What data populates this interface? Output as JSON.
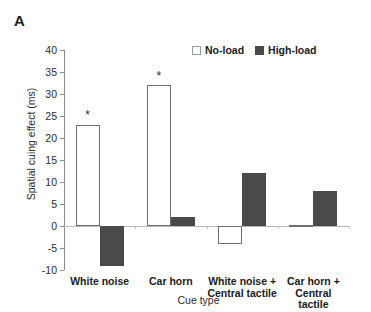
{
  "panel": {
    "letter": "A"
  },
  "chart_data": {
    "type": "bar",
    "title": "",
    "xlabel": "Cue type",
    "ylabel": "Spatial cuing effect (ms)",
    "categories": [
      "White noise",
      "Car horn",
      "White noise +\nCentral tactile",
      "Car horn +\nCentral tactile"
    ],
    "series": [
      {
        "name": "No-load",
        "values": [
          23,
          32,
          -4,
          0.3
        ],
        "color": "#ffffff",
        "edge": "#6e6e6e"
      },
      {
        "name": "High-load",
        "values": [
          -9,
          2,
          12,
          8
        ],
        "color": "#4a4a4a",
        "edge": "#4a4a4a"
      }
    ],
    "ylim": [
      -10,
      40
    ],
    "yticks": [
      40,
      35,
      30,
      25,
      20,
      15,
      10,
      5,
      0,
      -5,
      -10
    ],
    "ytick_labels": [
      "40",
      "35",
      "30",
      "25",
      "20",
      "15",
      "10",
      "5",
      "0",
      "-5",
      "-10"
    ],
    "grid": false,
    "legend_position": "top-right",
    "annotations": [
      {
        "text": "*",
        "group": 0,
        "series": "No-load",
        "value": 26.5
      },
      {
        "text": "*",
        "group": 1,
        "series": "No-load",
        "value": 35.5
      }
    ]
  }
}
